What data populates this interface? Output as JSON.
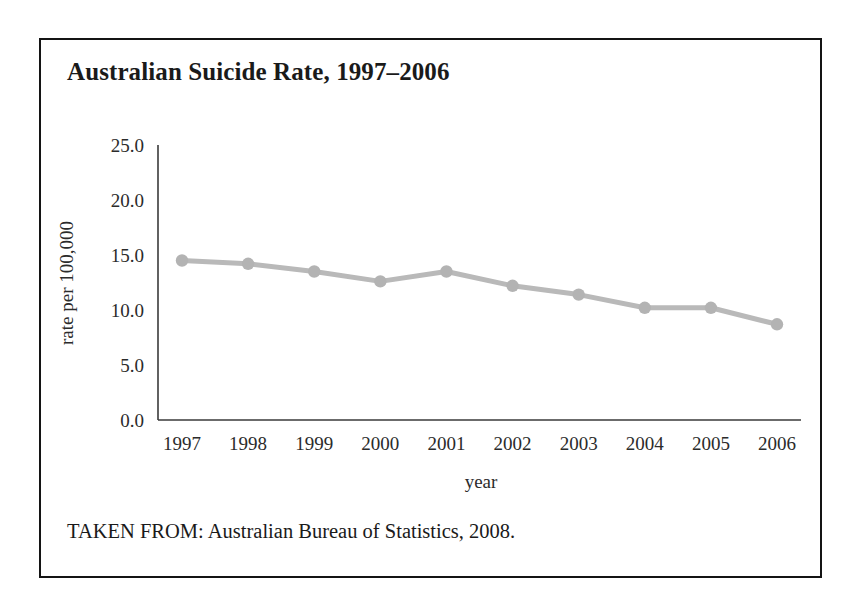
{
  "figure": {
    "title": "Australian Suicide Rate, 1997–2006",
    "source": "TAKEN FROM: Australian Bureau of Statistics, 2008."
  },
  "style": {
    "line_color": "#b9b9b9",
    "marker_color": "#b3b3b3",
    "axis_color": "#3a3a3a",
    "border_color": "#141414",
    "background": "#ffffff",
    "text_color": "#1a1a1a"
  },
  "chart_data": {
    "type": "line",
    "title": "Australian Suicide Rate, 1997–2006",
    "xlabel": "year",
    "ylabel": "rate per 100,000",
    "categories": [
      "1997",
      "1998",
      "1999",
      "2000",
      "2001",
      "2002",
      "2003",
      "2004",
      "2005",
      "2006"
    ],
    "values": [
      14.5,
      14.2,
      13.5,
      12.6,
      13.5,
      12.2,
      11.4,
      10.2,
      10.2,
      8.7
    ],
    "ylim": [
      0.0,
      25.0
    ],
    "ytick_labels": [
      "25.0",
      "20.0",
      "15.0",
      "10.0",
      "5.0",
      "0.0"
    ],
    "ytick_values": [
      25.0,
      20.0,
      15.0,
      10.0,
      5.0,
      0.0
    ],
    "grid": false,
    "legend": false,
    "markers": true,
    "marker_shape": "circle"
  }
}
